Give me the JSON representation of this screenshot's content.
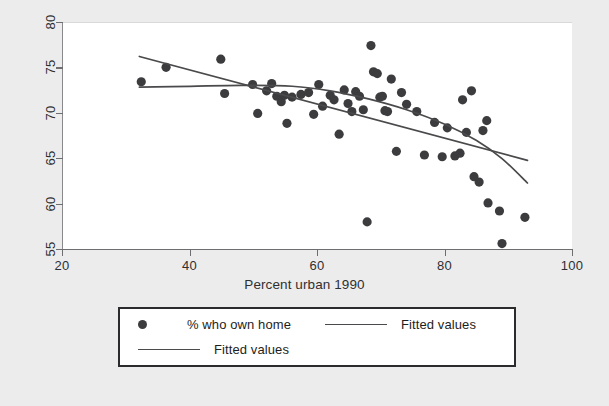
{
  "chart_data": {
    "type": "scatter",
    "title": "",
    "xlabel": "Percent urban 1990",
    "ylabel": "",
    "xlim": [
      20,
      100
    ],
    "ylim": [
      55,
      80
    ],
    "xticks": [
      20,
      40,
      60,
      80,
      100
    ],
    "yticks": [
      55,
      60,
      65,
      70,
      75,
      80
    ],
    "grid": false,
    "legend_position": "below-plot",
    "marker_color": "#3c3c3e",
    "line_color": "#4a4a4c",
    "series": [
      {
        "name": "% who own home",
        "type": "scatter",
        "points": [
          [
            32.3,
            73.5
          ],
          [
            36.2,
            75.1
          ],
          [
            44.8,
            76.0
          ],
          [
            45.4,
            72.2
          ],
          [
            49.8,
            73.2
          ],
          [
            50.6,
            70.0
          ],
          [
            52.0,
            72.5
          ],
          [
            52.8,
            73.3
          ],
          [
            53.6,
            71.9
          ],
          [
            54.3,
            71.3
          ],
          [
            54.8,
            72.0
          ],
          [
            55.2,
            68.9
          ],
          [
            56.0,
            71.8
          ],
          [
            57.4,
            72.1
          ],
          [
            58.6,
            72.3
          ],
          [
            59.4,
            69.9
          ],
          [
            60.2,
            73.2
          ],
          [
            60.8,
            70.8
          ],
          [
            62.0,
            72.0
          ],
          [
            62.6,
            71.5
          ],
          [
            63.4,
            67.7
          ],
          [
            64.2,
            72.6
          ],
          [
            64.8,
            71.1
          ],
          [
            65.4,
            70.2
          ],
          [
            66.0,
            72.4
          ],
          [
            66.6,
            71.9
          ],
          [
            67.2,
            70.4
          ],
          [
            67.8,
            58.0
          ],
          [
            68.4,
            77.5
          ],
          [
            68.8,
            74.6
          ],
          [
            69.4,
            74.4
          ],
          [
            69.8,
            71.8
          ],
          [
            70.2,
            71.9
          ],
          [
            70.6,
            70.3
          ],
          [
            71.0,
            70.2
          ],
          [
            71.6,
            73.8
          ],
          [
            72.4,
            65.8
          ],
          [
            73.2,
            72.3
          ],
          [
            74.0,
            71.0
          ],
          [
            75.6,
            70.2
          ],
          [
            76.8,
            65.4
          ],
          [
            78.4,
            69.0
          ],
          [
            79.6,
            65.2
          ],
          [
            80.4,
            68.4
          ],
          [
            81.6,
            65.3
          ],
          [
            82.4,
            65.6
          ],
          [
            82.8,
            71.5
          ],
          [
            83.4,
            67.9
          ],
          [
            84.2,
            72.5
          ],
          [
            84.6,
            63.0
          ],
          [
            85.4,
            62.4
          ],
          [
            86.0,
            68.1
          ],
          [
            86.6,
            69.2
          ],
          [
            86.8,
            60.1
          ],
          [
            88.6,
            59.2
          ],
          [
            89.0,
            55.6
          ],
          [
            92.6,
            58.5
          ]
        ]
      },
      {
        "name": "Fitted values",
        "type": "line",
        "shape": "straight",
        "points": [
          [
            32.0,
            76.3
          ],
          [
            93.0,
            64.8
          ]
        ]
      },
      {
        "name": "Fitted values",
        "type": "line",
        "shape": "curved",
        "points": [
          [
            32.0,
            72.9
          ],
          [
            40.0,
            73.0
          ],
          [
            48.0,
            73.1
          ],
          [
            56.0,
            73.0
          ],
          [
            62.0,
            72.5
          ],
          [
            68.0,
            71.6
          ],
          [
            74.0,
            70.4
          ],
          [
            80.0,
            68.8
          ],
          [
            85.0,
            67.0
          ],
          [
            89.0,
            65.0
          ],
          [
            93.0,
            62.3
          ]
        ]
      }
    ]
  },
  "legend": {
    "entries": [
      {
        "label": "% who own home",
        "marker": "dot"
      },
      {
        "label": "Fitted values",
        "marker": "line"
      },
      {
        "label": "Fitted values",
        "marker": "line"
      }
    ]
  }
}
